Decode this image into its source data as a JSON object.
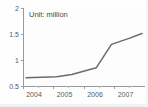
{
  "chart_data": {
    "type": "line",
    "title": "",
    "subtitle": "",
    "annotation": "Unit: million",
    "xlabel": "",
    "ylabel": "",
    "xlim": [
      2004,
      2008
    ],
    "ylim": [
      0.5,
      2
    ],
    "grid": false,
    "legend": null,
    "y_ticks": [
      0.5,
      1,
      1.5,
      2
    ],
    "y_tick_labels": [
      "0.5",
      "1",
      "1.5",
      "2"
    ],
    "x_ticks": [
      2004,
      2005,
      2006,
      2007
    ],
    "x_tick_labels": [
      "2004",
      "2005",
      "2006",
      "2007"
    ],
    "x_minor_ticks": [
      2004.5,
      2005.5,
      2006.5,
      2007.5
    ],
    "series": [
      {
        "name": "value",
        "color": "#6b6b6b",
        "x": [
          2004.1,
          2005.1,
          2005.6,
          2006.4,
          2006.9,
          2007.5,
          2007.9
        ],
        "values": [
          0.66,
          0.68,
          0.72,
          0.85,
          1.3,
          1.42,
          1.51
        ]
      }
    ]
  },
  "colors": {
    "background": "#fefefe",
    "axis": "#9a9a9a",
    "line": "#6b6b6b",
    "text": "#5a5a5a"
  }
}
